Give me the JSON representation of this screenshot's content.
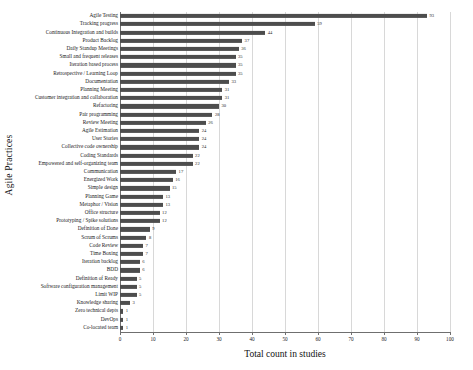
{
  "chart_data": {
    "type": "bar",
    "orientation": "horizontal",
    "title": "",
    "xlabel": "Total count in studies",
    "ylabel": "Agile Practices",
    "xlim": [
      0,
      100
    ],
    "xticks": [
      0,
      10,
      20,
      30,
      40,
      50,
      60,
      70,
      80,
      90,
      100
    ],
    "grid": true,
    "legend": false,
    "bar_color": "#4d4d4d",
    "categories": [
      "Agile Testing",
      "Tracking progress",
      "Continuous Integration and builds",
      "Product Backlog",
      "Daily Standup Meetings",
      "Small and frequent releases",
      "Iteration based process",
      "Retrospective / Learning Loop",
      "Documentation",
      "Planning Meeting",
      "Customer integration and collaboration",
      "Refactoring",
      "Pair programming",
      "Review Meeting",
      "Agile Estimation",
      "User Stories",
      "Collective code ownership",
      "Coding Standards",
      "Empowered and self-organizing team",
      "Communication",
      "Energized Work",
      "Simple design",
      "Planning Game",
      "Metaphor / Vision",
      "Office structure",
      "Prototyping / Spike solutions",
      "Definition of Done",
      "Scrum of Scrums",
      "Code Review",
      "Time Boxing",
      "Iteration backlog",
      "BDD",
      "Definition of Ready",
      "Software configuration management",
      "Limit WIP",
      "Knowledge sharing",
      "Zero technical depts",
      "DevOps",
      "Co-located team"
    ],
    "values": [
      93,
      59,
      44,
      37,
      36,
      35,
      35,
      35,
      33,
      31,
      31,
      30,
      28,
      26,
      24,
      24,
      24,
      22,
      22,
      17,
      16,
      15,
      13,
      13,
      12,
      12,
      9,
      8,
      7,
      7,
      6,
      6,
      5,
      5,
      5,
      3,
      1,
      1,
      1
    ]
  }
}
